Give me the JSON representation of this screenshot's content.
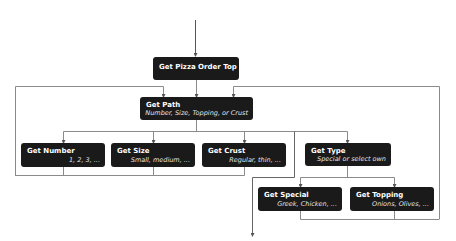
{
  "diagram": {
    "line_color": "#8a8a8a",
    "node_color": "#1a1a1a",
    "nodes": {
      "root": {
        "title": "Get Pizza Order Top",
        "subtitle": ""
      },
      "path": {
        "title": "Get Path",
        "subtitle": "Number, Size, Topping, or Crust"
      },
      "number": {
        "title": "Get Number",
        "subtitle": "1, 2, 3, ..."
      },
      "size": {
        "title": "Get Size",
        "subtitle": "Small, medium, ..."
      },
      "crust": {
        "title": "Get Crust",
        "subtitle": "Regular, thin, ..."
      },
      "type": {
        "title": "Get Type",
        "subtitle": "Special or select own"
      },
      "special": {
        "title": "Get Special",
        "subtitle": "Greek, Chicken, ..."
      },
      "topping": {
        "title": "Get Topping",
        "subtitle": "Onions, Olives, ..."
      }
    }
  }
}
